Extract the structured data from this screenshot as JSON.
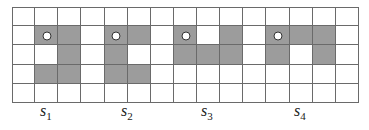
{
  "grid": {
    "cols": 15,
    "rows": 5,
    "colors": {
      "shaded": "#9c9c9c",
      "empty": "#ffffff",
      "line": "#6a6a6a"
    },
    "shaded_cells": [
      [
        1,
        1
      ],
      [
        1,
        2
      ],
      [
        2,
        2
      ],
      [
        3,
        1
      ],
      [
        3,
        2
      ],
      [
        1,
        4
      ],
      [
        1,
        5
      ],
      [
        2,
        4
      ],
      [
        3,
        4
      ],
      [
        3,
        5
      ],
      [
        1,
        7
      ],
      [
        1,
        9
      ],
      [
        2,
        7
      ],
      [
        2,
        8
      ],
      [
        2,
        9
      ],
      [
        1,
        11
      ],
      [
        1,
        12
      ],
      [
        1,
        13
      ],
      [
        2,
        11
      ],
      [
        2,
        13
      ]
    ],
    "markers": [
      [
        1,
        1
      ],
      [
        1,
        4
      ],
      [
        1,
        7
      ],
      [
        1,
        11
      ]
    ]
  },
  "labels": [
    {
      "base": "s",
      "sub": "1",
      "x": 40
    },
    {
      "base": "s",
      "sub": "2",
      "x": 121
    },
    {
      "base": "s",
      "sub": "3",
      "x": 201
    },
    {
      "base": "s",
      "sub": "4",
      "x": 294
    }
  ]
}
